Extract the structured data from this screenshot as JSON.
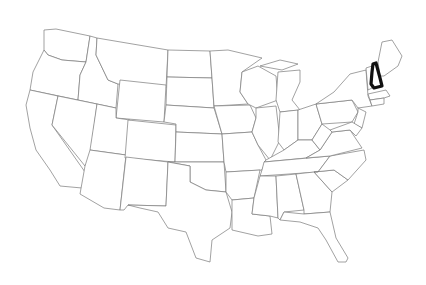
{
  "map": {
    "type": "outline-map",
    "region": "United States (contiguous 48 states)",
    "labels_visible": false,
    "highlighted_state": "New Hampshire",
    "colors": {
      "background": "#ffffff",
      "state_fill": "#ffffff",
      "state_border": "#7a7a7a",
      "highlight_border": "#111111"
    }
  }
}
